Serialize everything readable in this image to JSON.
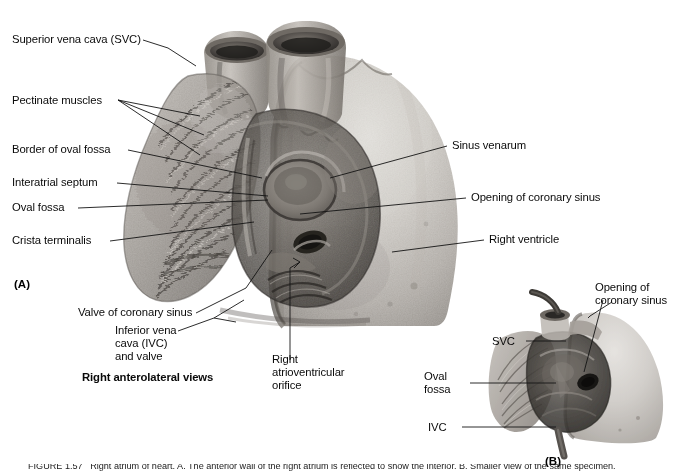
{
  "figure": {
    "panel_a_mark": "(A)",
    "panel_b_mark": "(B)",
    "view_caption": "Right anterolateral views",
    "bottom_caption": "FIGURE 1.57   Right atrium of heart. A. The anterior wall of the right atrium is reflected to show the interior. B. Smaller view of the same specimen."
  },
  "labels_left": [
    {
      "id": "svc",
      "text": "Superior vena cava (SVC)"
    },
    {
      "id": "pectinate",
      "text": "Pectinate muscles"
    },
    {
      "id": "border_oval_fossa",
      "text": "Border of oval fossa"
    },
    {
      "id": "interatrial_septum",
      "text": "Interatrial septum"
    },
    {
      "id": "oval_fossa",
      "text": "Oval fossa"
    },
    {
      "id": "crista_terminalis",
      "text": "Crista terminalis"
    }
  ],
  "labels_right": [
    {
      "id": "sinus_venarum",
      "text": "Sinus venarum"
    },
    {
      "id": "opening_coronary_sinus",
      "text": "Opening of coronary sinus"
    },
    {
      "id": "right_ventricle",
      "text": "Right ventricle"
    }
  ],
  "labels_bottom": [
    {
      "id": "valve_coronary_sinus",
      "text": "Valve of coronary sinus"
    },
    {
      "id": "ivc_valve",
      "text": "Inferior vena\ncava (IVC)\nand valve"
    },
    {
      "id": "right_av_orifice",
      "text": "Right\natrioventricular\norifice"
    }
  ],
  "labels_panel_b": [
    {
      "id": "b_opening_coronary_sinus",
      "text": "Opening of\ncoronary sinus"
    },
    {
      "id": "b_svc",
      "text": "SVC"
    },
    {
      "id": "b_oval_fossa",
      "text": "Oval\nfossa"
    },
    {
      "id": "b_ivc",
      "text": "IVC"
    }
  ],
  "colors": {
    "background": "#ffffff",
    "ink": "#0a0a0a",
    "leader": "#141414",
    "tissue_light": "#cfcbc6",
    "tissue_mid": "#a6a19b",
    "tissue_dark": "#6d6862",
    "cavity_dark": "#3a3733",
    "cavity_deep": "#23211e",
    "vessel_dark": "#4a4641"
  }
}
